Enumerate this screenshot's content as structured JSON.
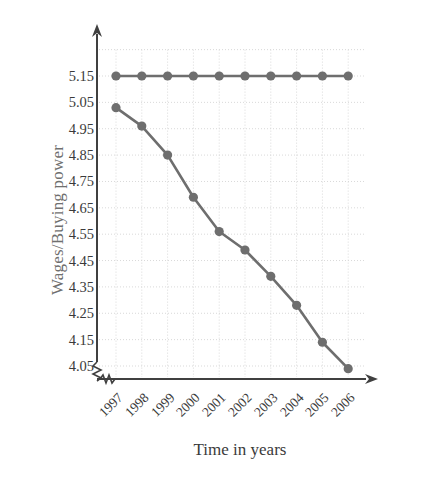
{
  "chart_data": {
    "type": "line",
    "title": "",
    "xlabel": "Time in years",
    "ylabel": "Wages/Buying power",
    "categories": [
      "1997",
      "1998",
      "1999",
      "2000",
      "2001",
      "2002",
      "2003",
      "2004",
      "2005",
      "2006"
    ],
    "y_ticks": [
      "5.15",
      "5.05",
      "4.95",
      "4.85",
      "4.75",
      "4.65",
      "4.55",
      "4.45",
      "4.35",
      "4.25",
      "4.15",
      "4.05"
    ],
    "ylim": [
      4.0,
      5.25
    ],
    "xlim": [
      1996.6,
      2006.6
    ],
    "grid": true,
    "legend": "none",
    "axis_break_x": true,
    "axis_break_y": true,
    "series": [
      {
        "name": "Wages",
        "marker": "circle",
        "color": "#6e6e6e",
        "values": [
          5.15,
          5.15,
          5.15,
          5.15,
          5.15,
          5.15,
          5.15,
          5.15,
          5.15,
          5.15
        ]
      },
      {
        "name": "Buying power",
        "marker": "circle",
        "color": "#6e6e6e",
        "values": [
          5.03,
          4.96,
          4.85,
          4.69,
          4.56,
          4.49,
          4.39,
          4.28,
          4.14,
          4.04
        ]
      }
    ]
  },
  "axes": {
    "y_axis_arrow": "arrow-up",
    "x_axis_arrow": "arrow-right",
    "axis_color": "#404040",
    "grid_color": "#d9d9d9"
  }
}
